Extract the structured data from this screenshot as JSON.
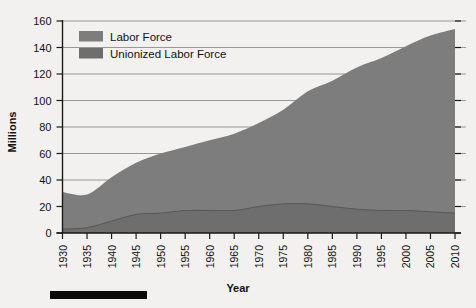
{
  "chart_data": {
    "type": "area",
    "title": "",
    "xlabel": "Year",
    "ylabel": "Millions",
    "xlim": [
      1930,
      2010
    ],
    "ylim": [
      0,
      160
    ],
    "grid": true,
    "legend_position": "top-left-inside",
    "x": [
      1930,
      1935,
      1940,
      1945,
      1950,
      1955,
      1960,
      1965,
      1970,
      1975,
      1980,
      1985,
      1990,
      1995,
      2000,
      2005,
      2010
    ],
    "xtick_labels": [
      "1930",
      "1935",
      "1940",
      "1945",
      "1950",
      "1955",
      "1960",
      "1965",
      "1970",
      "1975",
      "1980",
      "1985",
      "1990",
      "1995",
      "2000",
      "2005",
      "2010"
    ],
    "ytick_labels": [
      "0",
      "20",
      "40",
      "60",
      "80",
      "100",
      "120",
      "140",
      "160"
    ],
    "ytick_values": [
      0,
      20,
      40,
      60,
      80,
      100,
      120,
      140,
      160
    ],
    "series": [
      {
        "name": "Labor Force",
        "color": "#7d7d7d",
        "values": [
          31,
          29,
          42,
          53,
          60,
          65,
          70,
          75,
          83,
          93,
          107,
          115,
          125,
          132,
          141,
          149,
          154
        ]
      },
      {
        "name": "Unionized Labor Force",
        "color": "#6e6e6e",
        "values": [
          3,
          4,
          9,
          14,
          15,
          17,
          17,
          17,
          20,
          22,
          22,
          20,
          18,
          17,
          17,
          16,
          15
        ]
      }
    ],
    "annotations": []
  },
  "legend": {
    "items": [
      {
        "label": "Labor Force",
        "swatch_color": "#7d7d7d"
      },
      {
        "label": "Unionized Labor Force",
        "swatch_color": "#6e6e6e"
      }
    ]
  },
  "axes": {
    "y_title": "Millions",
    "x_title": "Year"
  },
  "decoration": {
    "footer_bar_color": "#0a0a0a"
  },
  "colors": {
    "background": "#f2f1ef",
    "axis": "#1a1a1a",
    "gridline": "#8d8d8d",
    "area_fill": "#7d7d7d",
    "area_fill_lower": "#6e6e6e"
  }
}
